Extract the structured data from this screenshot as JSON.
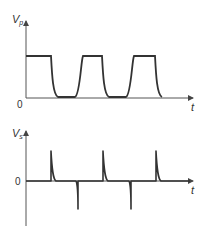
{
  "diagram": {
    "top_plot": {
      "y_label": "V",
      "y_label_sub": "p",
      "x_label": "t",
      "origin_label": "0",
      "waveform": "square wave with rounded (RC) rise/fall edges"
    },
    "bottom_plot": {
      "y_label": "V",
      "y_label_sub": "s",
      "x_label": "t",
      "origin_label": "0",
      "waveform": "alternating positive and negative spikes at square-wave edges"
    },
    "colors": {
      "line": "#333333",
      "axis": "#555555"
    }
  }
}
